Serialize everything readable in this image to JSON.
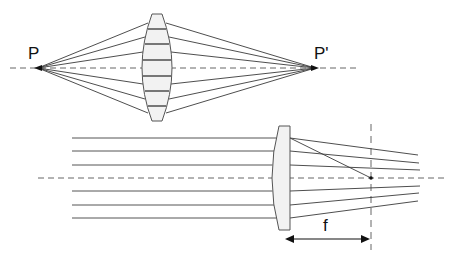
{
  "labels": {
    "source_point": "P",
    "image_point": "P'",
    "focal_length": "f"
  },
  "colors": {
    "ray": "#3a3a3a",
    "axis": "#666666",
    "lens_fill": "#f2f2f2",
    "lens_stroke": "#555555",
    "lens_band": "#777777"
  },
  "top_panel": {
    "description": "Biconvex lens imaging point P to point P'",
    "axis_y": 68,
    "source_x": 38,
    "image_x": 315,
    "lens_center_x": 157,
    "ray_lens_hits_y": [
      23,
      37,
      52,
      68,
      83,
      98,
      113
    ],
    "band_y": [
      29,
      44,
      60,
      76,
      91,
      106
    ]
  },
  "bottom_panel": {
    "description": "Parallel rays focused by plano-convex lens to focal point at distance f",
    "axis_y": 178,
    "ray_y": [
      138,
      151,
      165,
      191,
      205,
      218
    ],
    "ray_start_x": 72,
    "lens_flat_x": 290,
    "focal_x": 371
  }
}
